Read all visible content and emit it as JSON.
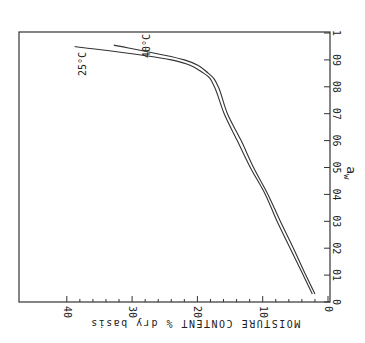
{
  "chart_data": {
    "type": "line",
    "title": "",
    "orientation_note": "figure rotated 90 degrees: a_w axis vertical at right, moisture axis horizontal at bottom (reversed, printed upside-down)",
    "xlabel": "a_w",
    "ylabel": "MOISTURE CONTENT % dry basis",
    "xlim": [
      0,
      1
    ],
    "ylim": [
      0,
      40
    ],
    "grid": false,
    "legend": "inline labels",
    "x_ticks": [
      "0",
      "01",
      "02",
      "03",
      "04",
      "05",
      "06",
      "07",
      "08",
      "09",
      "1"
    ],
    "y_ticks": [
      "0",
      "10",
      "20",
      "30",
      "40"
    ],
    "series": [
      {
        "name": "25°C",
        "x": [
          0.03,
          0.1,
          0.2,
          0.3,
          0.4,
          0.5,
          0.6,
          0.7,
          0.8,
          0.85,
          0.9,
          0.95
        ],
        "values": [
          2.4,
          3.8,
          5.8,
          7.8,
          9.6,
          11.9,
          13.9,
          15.9,
          17.4,
          19.0,
          24.0,
          38.8
        ]
      },
      {
        "name": "40°C",
        "x": [
          0.03,
          0.1,
          0.2,
          0.3,
          0.4,
          0.5,
          0.6,
          0.7,
          0.8,
          0.85,
          0.9,
          0.955
        ],
        "values": [
          2.0,
          3.4,
          5.3,
          7.3,
          9.2,
          11.4,
          13.3,
          15.4,
          16.8,
          18.3,
          22.0,
          32.8
        ]
      }
    ],
    "annotations": [
      "25°C",
      "40°C"
    ]
  },
  "labels": {
    "x_title": "a",
    "x_title_sub": "w",
    "y_title": "MOISTURE CONTENT  % dry basis",
    "curve_25": "25°C",
    "curve_40": "40°C"
  }
}
